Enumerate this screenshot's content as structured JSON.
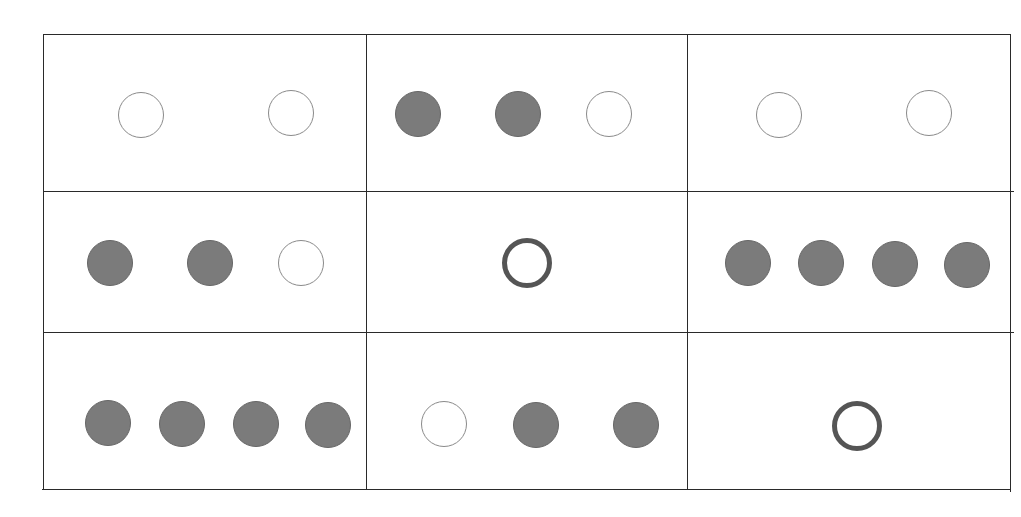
{
  "diagram": {
    "colors": {
      "filled": "#7b7b7b",
      "outline": "#8a8a8a",
      "thick_outline": "#555555",
      "grid": "#2a2a2a"
    },
    "grid": {
      "vertical_lines": [
        {
          "x": 43,
          "y1": 34,
          "y2": 490
        },
        {
          "x": 366,
          "y1": 34,
          "y2": 490
        },
        {
          "x": 687,
          "y1": 34,
          "y2": 490
        },
        {
          "x": 1010,
          "y1": 34,
          "y2": 492
        }
      ],
      "horizontal_lines": [
        {
          "y": 34,
          "x1": 43,
          "x2": 1010
        },
        {
          "y": 191,
          "x1": 43,
          "x2": 1014
        },
        {
          "y": 332,
          "x1": 43,
          "x2": 1014
        },
        {
          "y": 489,
          "x1": 42,
          "x2": 1010
        }
      ]
    },
    "cells": [
      {
        "row": 1,
        "col": 1,
        "circles": [
          {
            "type": "empty",
            "cx": 141,
            "cy": 115,
            "d": 46
          },
          {
            "type": "empty",
            "cx": 291,
            "cy": 113,
            "d": 46
          }
        ]
      },
      {
        "row": 1,
        "col": 2,
        "circles": [
          {
            "type": "filled",
            "cx": 418,
            "cy": 114,
            "d": 46
          },
          {
            "type": "filled",
            "cx": 518,
            "cy": 114,
            "d": 46
          },
          {
            "type": "empty",
            "cx": 609,
            "cy": 114,
            "d": 46
          }
        ]
      },
      {
        "row": 1,
        "col": 3,
        "circles": [
          {
            "type": "empty",
            "cx": 779,
            "cy": 115,
            "d": 46
          },
          {
            "type": "empty",
            "cx": 929,
            "cy": 113,
            "d": 46
          }
        ]
      },
      {
        "row": 2,
        "col": 1,
        "circles": [
          {
            "type": "filled",
            "cx": 110,
            "cy": 263,
            "d": 46
          },
          {
            "type": "filled",
            "cx": 210,
            "cy": 263,
            "d": 46
          },
          {
            "type": "empty",
            "cx": 301,
            "cy": 263,
            "d": 46
          }
        ]
      },
      {
        "row": 2,
        "col": 2,
        "circles": [
          {
            "type": "thick",
            "cx": 527,
            "cy": 263,
            "d": 50
          }
        ]
      },
      {
        "row": 2,
        "col": 3,
        "circles": [
          {
            "type": "filled",
            "cx": 748,
            "cy": 263,
            "d": 46
          },
          {
            "type": "filled",
            "cx": 821,
            "cy": 263,
            "d": 46
          },
          {
            "type": "filled",
            "cx": 895,
            "cy": 264,
            "d": 46
          },
          {
            "type": "filled",
            "cx": 967,
            "cy": 265,
            "d": 46
          }
        ]
      },
      {
        "row": 3,
        "col": 1,
        "circles": [
          {
            "type": "filled",
            "cx": 108,
            "cy": 423,
            "d": 46
          },
          {
            "type": "filled",
            "cx": 182,
            "cy": 424,
            "d": 46
          },
          {
            "type": "filled",
            "cx": 256,
            "cy": 424,
            "d": 46
          },
          {
            "type": "filled",
            "cx": 328,
            "cy": 425,
            "d": 46
          }
        ]
      },
      {
        "row": 3,
        "col": 2,
        "circles": [
          {
            "type": "empty",
            "cx": 444,
            "cy": 424,
            "d": 46
          },
          {
            "type": "filled",
            "cx": 536,
            "cy": 425,
            "d": 46
          },
          {
            "type": "filled",
            "cx": 636,
            "cy": 425,
            "d": 46
          }
        ]
      },
      {
        "row": 3,
        "col": 3,
        "circles": [
          {
            "type": "thick",
            "cx": 857,
            "cy": 426,
            "d": 50
          }
        ]
      }
    ]
  }
}
